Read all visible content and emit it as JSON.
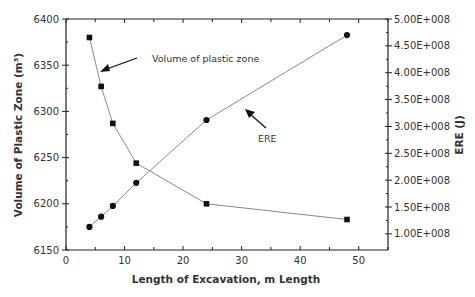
{
  "chart_data": {
    "type": "line",
    "title": "",
    "xlabel": "Length of Excavation, m Length",
    "ylabel": "Volume of Plastic Zone (m³)",
    "y2label": "ERE (J)",
    "xlim": [
      0,
      55
    ],
    "ylim": [
      6150,
      6400
    ],
    "y2lim": [
      70000000,
      500000000
    ],
    "x_ticks": [
      "0",
      "10",
      "20",
      "30",
      "40",
      "50"
    ],
    "y_ticks": [
      "6150",
      "6200",
      "6250",
      "6300",
      "6350",
      "6400"
    ],
    "y2_ticks": [
      "1.00E+008",
      "1.50E+008",
      "2.00E+008",
      "2.50E+008",
      "3.00E+008",
      "3.50E+008",
      "4.00E+008",
      "4.50E+008",
      "5.00E+008"
    ],
    "grid": false,
    "series": [
      {
        "name": "Volume of plastic zone",
        "axis": "left",
        "marker": "square",
        "x": [
          4,
          6,
          8,
          12,
          24,
          48
        ],
        "values": [
          6380,
          6327,
          6287,
          6244,
          6200,
          6183
        ]
      },
      {
        "name": "ERE",
        "axis": "right",
        "marker": "circle",
        "x": [
          4,
          6,
          8,
          12,
          24,
          48
        ],
        "values": [
          113000000,
          132000000,
          152000000,
          195000000,
          312000000,
          470000000
        ]
      }
    ],
    "annotations": [
      {
        "text": "Volume of plastic zone",
        "arrow_to": "Volume of plastic zone series near x=6"
      },
      {
        "text": "ERE",
        "arrow_to": "ERE series near x=28"
      }
    ]
  }
}
